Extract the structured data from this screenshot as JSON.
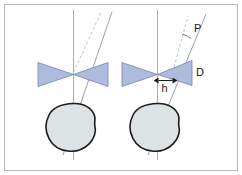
{
  "figure": {
    "title": "",
    "background_color": "#ffffff",
    "frame_color": "#b9b9b9",
    "colors": {
      "bowtie_fill": "#aebbdc",
      "bowtie_stroke": "#6f7fb3",
      "blob_fill": "#dde2e4",
      "blob_stroke": "#1c1c1c",
      "axis_line": "#9aa0a6",
      "beam_line": "#9aa0a6",
      "dashed_line": "#b0b6bb",
      "label_color": "#1a1a1a"
    },
    "labels": {
      "angle_p": "P",
      "detector_d": "D",
      "offset_h": "h"
    },
    "panels": [
      {
        "id": "left-panel",
        "name": "aligned-beam-case",
        "has_angle_label": false,
        "has_offset_label": false,
        "has_detector_label": false
      },
      {
        "id": "right-panel",
        "name": "tilted-beam-case",
        "has_angle_label": true,
        "has_offset_label": true,
        "has_detector_label": true
      }
    ],
    "elements": {
      "vertical_axis": "vertical reference axis",
      "dashed_ray": "nominal (undeviated) ray",
      "solid_ray": "actual tilted ray",
      "bowtie": "double-cone collimator / beam profile",
      "blob": "sample cross-section"
    }
  }
}
